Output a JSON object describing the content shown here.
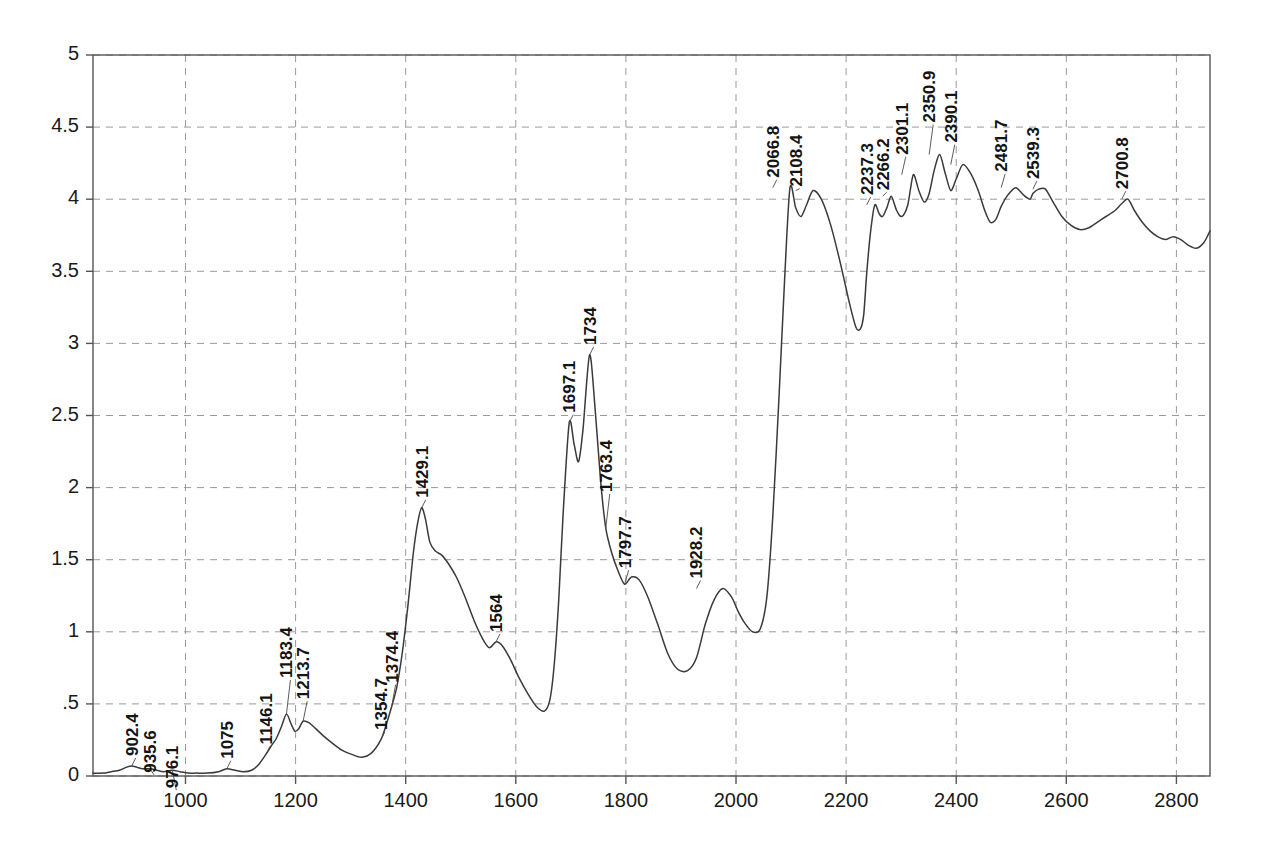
{
  "chart_data": {
    "type": "line",
    "title": "",
    "subtitle": "",
    "xlabel": "",
    "ylabel": "",
    "xlim": [
      832,
      2861
    ],
    "ylim": [
      0,
      5
    ],
    "grid": true,
    "legend": null,
    "x_ticks": [
      1000,
      1200,
      1400,
      1600,
      1800,
      2000,
      2200,
      2400,
      2600,
      2800
    ],
    "x_tick_labels": [
      "1000",
      "1200",
      "1400",
      "1600",
      "1800",
      "2000",
      "2200",
      "2400",
      "2600",
      "2800"
    ],
    "y_ticks": [
      0,
      0.5,
      1,
      1.5,
      2,
      2.5,
      3,
      3.5,
      4,
      4.5,
      5
    ],
    "y_tick_labels": [
      "0",
      ".5",
      "1",
      "1.5",
      "2",
      "2.5",
      "3",
      "3.5",
      "4",
      "4.5",
      "5"
    ],
    "line_color": "#3a3a3a",
    "grid_color": "#9a9a9a",
    "axis_color": "#555555",
    "annotations": [
      {
        "label": "902.4",
        "x": 902.4,
        "y": 0.07
      },
      {
        "label": "935.6",
        "x": 935.6,
        "y": 0.05
      },
      {
        "label": "976.1",
        "x": 976.1,
        "y": 0.04
      },
      {
        "label": "1075",
        "x": 1075,
        "y": 0.05
      },
      {
        "label": "1146.1",
        "x": 1146.1,
        "y": 0.15
      },
      {
        "label": "1183.4",
        "x": 1183.4,
        "y": 0.43
      },
      {
        "label": "1213.7",
        "x": 1213.7,
        "y": 0.38
      },
      {
        "label": "1354.7",
        "x": 1354.7,
        "y": 0.25
      },
      {
        "label": "1374.4",
        "x": 1374.4,
        "y": 0.48
      },
      {
        "label": "1429.1",
        "x": 1429.1,
        "y": 1.86
      },
      {
        "label": "1564",
        "x": 1564,
        "y": 0.93
      },
      {
        "label": "1697.1",
        "x": 1697.1,
        "y": 2.45
      },
      {
        "label": "1734",
        "x": 1734,
        "y": 2.92
      },
      {
        "label": "1763.4",
        "x": 1763.4,
        "y": 1.72
      },
      {
        "label": "1797.7",
        "x": 1797.7,
        "y": 1.33
      },
      {
        "label": "1928.2",
        "x": 1928.2,
        "y": 1.3
      },
      {
        "label": "2066.8",
        "x": 2066.8,
        "y": 4.08
      },
      {
        "label": "2108.4",
        "x": 2108.4,
        "y": 4.06
      },
      {
        "label": "2237.3",
        "x": 2237.3,
        "y": 3.96
      },
      {
        "label": "2266.2",
        "x": 2266.2,
        "y": 4.02
      },
      {
        "label": "2301.1",
        "x": 2301.1,
        "y": 4.17
      },
      {
        "label": "2350.9",
        "x": 2350.9,
        "y": 4.31
      },
      {
        "label": "2390.1",
        "x": 2390.1,
        "y": 4.24
      },
      {
        "label": "2481.7",
        "x": 2481.7,
        "y": 4.08
      },
      {
        "label": "2539.3",
        "x": 2539.3,
        "y": 4.07
      },
      {
        "label": "2700.8",
        "x": 2700.8,
        "y": 4.0
      }
    ],
    "x": [
      832,
      850,
      865,
      880,
      892,
      902.4,
      912,
      922,
      935.6,
      948,
      960,
      976.1,
      990,
      1005,
      1020,
      1040,
      1060,
      1075,
      1090,
      1105,
      1120,
      1133,
      1146.1,
      1156,
      1165,
      1174,
      1183.4,
      1192,
      1199,
      1206,
      1213.7,
      1224,
      1236,
      1250,
      1266,
      1284,
      1302,
      1320,
      1338,
      1354.7,
      1365,
      1374.4,
      1384,
      1394,
      1404,
      1414,
      1422,
      1429.1,
      1436,
      1444,
      1454,
      1466,
      1478,
      1492,
      1508,
      1524,
      1540,
      1552,
      1564,
      1576,
      1590,
      1606,
      1622,
      1638,
      1652,
      1662,
      1670,
      1678,
      1686,
      1697.1,
      1706,
      1714,
      1722,
      1734,
      1744,
      1754,
      1763.4,
      1774,
      1786,
      1797.7,
      1810,
      1824,
      1840,
      1858,
      1876,
      1894,
      1912,
      1928.2,
      1944,
      1960,
      1976,
      1992,
      2004,
      2016,
      2030,
      2044,
      2056,
      2066.8,
      2078,
      2088,
      2098,
      2108.4,
      2118,
      2128,
      2140,
      2155,
      2172,
      2190,
      2206,
      2218,
      2226,
      2232,
      2237.3,
      2244,
      2252,
      2260,
      2266.2,
      2274,
      2282,
      2292,
      2301.1,
      2312,
      2322,
      2332,
      2342,
      2350.9,
      2360,
      2370,
      2380,
      2390.1,
      2400,
      2412,
      2426,
      2440,
      2452,
      2462,
      2472,
      2481.7,
      2494,
      2508,
      2522,
      2534,
      2539.3,
      2550,
      2562,
      2576,
      2592,
      2608,
      2624,
      2640,
      2656,
      2672,
      2688,
      2700.8,
      2712,
      2724,
      2738,
      2752,
      2766,
      2780,
      2794,
      2808,
      2822,
      2836,
      2850,
      2861
    ],
    "y": [
      0.02,
      0.02,
      0.03,
      0.04,
      0.06,
      0.07,
      0.06,
      0.05,
      0.05,
      0.04,
      0.03,
      0.04,
      0.03,
      0.02,
      0.02,
      0.02,
      0.03,
      0.05,
      0.04,
      0.03,
      0.04,
      0.08,
      0.15,
      0.21,
      0.26,
      0.34,
      0.43,
      0.36,
      0.31,
      0.33,
      0.38,
      0.37,
      0.33,
      0.28,
      0.23,
      0.18,
      0.15,
      0.13,
      0.16,
      0.25,
      0.36,
      0.48,
      0.62,
      0.86,
      1.18,
      1.55,
      1.76,
      1.86,
      1.78,
      1.62,
      1.56,
      1.53,
      1.47,
      1.38,
      1.24,
      1.08,
      0.95,
      0.89,
      0.93,
      0.9,
      0.81,
      0.68,
      0.57,
      0.48,
      0.45,
      0.53,
      0.78,
      1.22,
      1.82,
      2.45,
      2.3,
      2.18,
      2.4,
      2.92,
      2.55,
      2.05,
      1.72,
      1.55,
      1.42,
      1.33,
      1.38,
      1.36,
      1.24,
      1.05,
      0.85,
      0.74,
      0.73,
      0.82,
      1.05,
      1.22,
      1.3,
      1.24,
      1.14,
      1.06,
      1.0,
      1.02,
      1.24,
      1.8,
      2.62,
      3.42,
      4.08,
      3.94,
      3.88,
      3.96,
      4.06,
      4.0,
      3.82,
      3.55,
      3.28,
      3.11,
      3.1,
      3.2,
      3.48,
      3.76,
      3.96,
      3.9,
      3.88,
      3.94,
      4.02,
      3.92,
      3.88,
      3.96,
      4.17,
      4.06,
      3.98,
      4.04,
      4.2,
      4.31,
      4.18,
      4.06,
      4.14,
      4.24,
      4.18,
      4.06,
      3.92,
      3.84,
      3.86,
      3.95,
      4.03,
      4.08,
      4.03,
      4.0,
      4.04,
      4.07,
      4.07,
      3.98,
      3.88,
      3.82,
      3.79,
      3.8,
      3.84,
      3.88,
      3.92,
      3.97,
      4.0,
      3.92,
      3.84,
      3.78,
      3.74,
      3.72,
      3.74,
      3.72,
      3.68,
      3.66,
      3.7,
      3.78,
      3.82
    ]
  }
}
